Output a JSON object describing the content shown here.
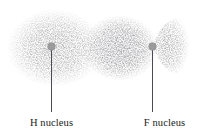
{
  "figure": {
    "type": "electron-density-diagram",
    "molecule": "HF",
    "background_color": "#ffffff",
    "nucleus_dot_color": "#9b9b9b",
    "leader_line_color": "#4a4a52",
    "label_color": "#1a1a1a",
    "cloud_color": "#e9e9ec"
  },
  "labels": {
    "hydrogen": "H nucleus",
    "fluorine": "F nucleus"
  },
  "nuclei": [
    {
      "element": "H",
      "label": "H nucleus",
      "x": 51,
      "y": 46
    },
    {
      "element": "F",
      "label": "F nucleus",
      "x": 152,
      "y": 46
    }
  ],
  "electron_density": {
    "lobes": [
      {
        "name": "hydrogen-lobe",
        "cx": 55,
        "cy": 48,
        "rx": 48,
        "ry": 39,
        "opacity": 0.45
      },
      {
        "name": "fluorine-lobe",
        "cx": 120,
        "cy": 48,
        "rx": 38,
        "ry": 33,
        "opacity": 0.95
      },
      {
        "name": "fluorine-lone-pair-lobe",
        "cx": 172,
        "cy": 45,
        "rx": 19,
        "ry": 27,
        "opacity": 0.5
      }
    ]
  }
}
